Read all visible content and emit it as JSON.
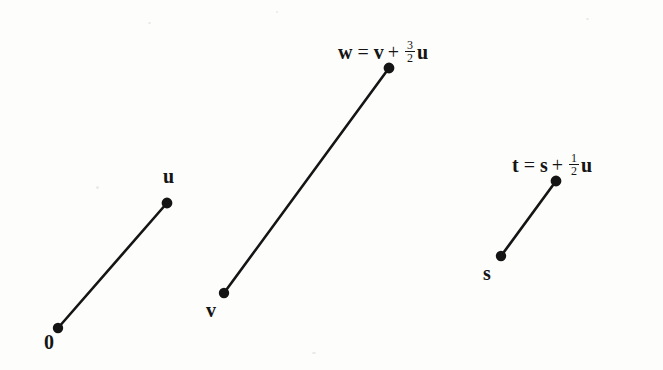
{
  "figure": {
    "background_color": "#fdfdfc",
    "ink_color": "#151515",
    "width": 663,
    "height": 370
  },
  "vectors": [
    {
      "name": "u-vector",
      "tail_label": "0",
      "head_label": "u",
      "tail": {
        "x": 58,
        "y": 328
      },
      "head": {
        "x": 167,
        "y": 203
      }
    },
    {
      "name": "w-vector",
      "tail_label": "v",
      "head_label": "w",
      "tail": {
        "x": 224,
        "y": 293
      },
      "head": {
        "x": 389,
        "y": 68
      }
    },
    {
      "name": "t-vector",
      "tail_label": "s",
      "head_label": "t",
      "tail": {
        "x": 501,
        "y": 256
      },
      "head": {
        "x": 556,
        "y": 181
      }
    }
  ],
  "labels": {
    "origin": "0",
    "u": "u",
    "v": "v",
    "s": "s"
  },
  "formulas": {
    "w": {
      "lhs": "w",
      "equals": "=",
      "term1": "v",
      "plus": "+",
      "numerator": "3",
      "denominator": "2",
      "term2": "u",
      "text": "w = v + 3/2 u"
    },
    "t": {
      "lhs": "t",
      "equals": "=",
      "term1": "s",
      "plus": "+",
      "numerator": "1",
      "denominator": "2",
      "term2": "u",
      "text": "t = s + 1/2 u"
    }
  }
}
